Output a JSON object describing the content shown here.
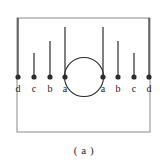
{
  "figure": {
    "caption": "( a )",
    "frame": {
      "x": 17,
      "y": 18,
      "width": 133,
      "height": 114,
      "stroke": "#8a8a8a",
      "stroke_width": 1
    },
    "baseline_y": 77,
    "stroke_color": "#2b2b2b",
    "dot_color": "#2b2b2b",
    "dot_radius": 2.6,
    "circle": {
      "cx": 84,
      "cy": 77,
      "r": 19.5,
      "stroke": "#2b2b2b",
      "stroke_width": 1.1
    },
    "points": [
      {
        "label": "d",
        "x": 18,
        "line_top_y": 18,
        "side": "left"
      },
      {
        "label": "c",
        "x": 34,
        "line_top_y": 53,
        "side": "left"
      },
      {
        "label": "b",
        "x": 50,
        "line_top_y": 41,
        "side": "left"
      },
      {
        "label": "a",
        "x": 65,
        "line_top_y": 27,
        "side": "left"
      },
      {
        "label": "a",
        "x": 103,
        "line_top_y": 27,
        "side": "right"
      },
      {
        "label": "b",
        "x": 118,
        "line_top_y": 41,
        "side": "right"
      },
      {
        "label": "c",
        "x": 134,
        "line_top_y": 53,
        "side": "right"
      },
      {
        "label": "d",
        "x": 149,
        "line_top_y": 18,
        "side": "right"
      }
    ],
    "label_y": 92,
    "caption_x": 84,
    "caption_y": 154
  }
}
